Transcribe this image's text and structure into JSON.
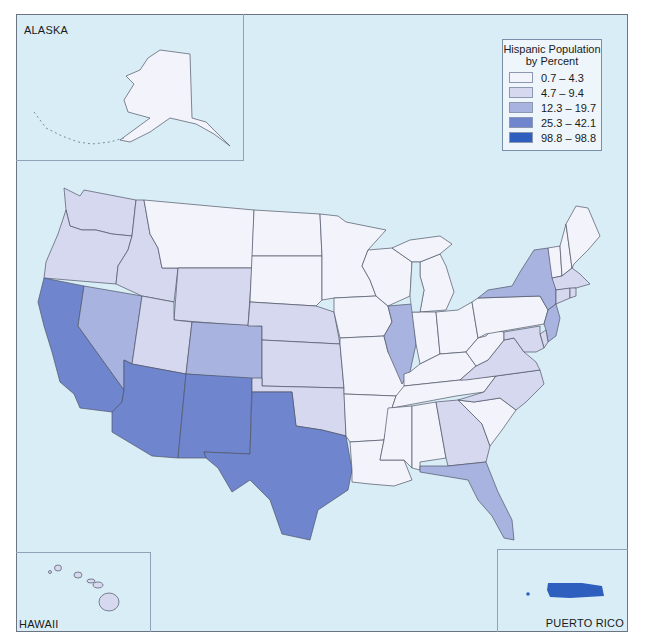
{
  "legend": {
    "title_line1": "Hispanic Population",
    "title_line2": "by Percent",
    "classes": [
      {
        "label": "0.7 – 4.3",
        "color": "#f3f4fb"
      },
      {
        "label": "4.7 – 9.4",
        "color": "#d6d8f0"
      },
      {
        "label": "12.3 – 19.7",
        "color": "#a9b3e0"
      },
      {
        "label": "25.3 – 42.1",
        "color": "#6f86cf"
      },
      {
        "label": "98.8 – 98.8",
        "color": "#2e5fbf"
      }
    ]
  },
  "insets": {
    "alaska": {
      "label": "ALASKA",
      "class": 0
    },
    "hawaii": {
      "label": "HAWAII",
      "class": 1
    },
    "puerto_rico": {
      "label": "PUERTO RICO",
      "class": 4
    }
  },
  "colors": {
    "water": "#d9edf6",
    "border": "#4f5566",
    "frame": "#6b7480"
  },
  "states": {
    "WA": 1,
    "OR": 1,
    "ID": 1,
    "MT": 0,
    "WY": 1,
    "ND": 0,
    "SD": 0,
    "NE": 1,
    "KS": 1,
    "OK": 1,
    "CA": 3,
    "NV": 2,
    "UT": 1,
    "CO": 2,
    "AZ": 3,
    "NM": 3,
    "TX": 3,
    "MN": 0,
    "IA": 0,
    "MO": 0,
    "AR": 0,
    "LA": 0,
    "WI": 0,
    "IL": 2,
    "MI": 0,
    "IN": 0,
    "OH": 0,
    "KY": 0,
    "TN": 0,
    "MS": 0,
    "AL": 0,
    "GA": 1,
    "FL": 2,
    "SC": 0,
    "NC": 1,
    "VA": 1,
    "WV": 0,
    "PA": 0,
    "NY": 2,
    "NJ": 2,
    "DE": 1,
    "MD": 1,
    "CT": 1,
    "RI": 1,
    "MA": 1,
    "VT": 0,
    "NH": 0,
    "ME": 0
  }
}
